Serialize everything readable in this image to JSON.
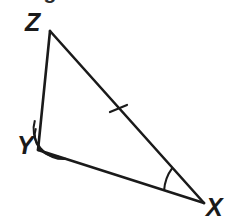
{
  "figure": {
    "name": "triangle-XYZ",
    "background_color": "#ffffff",
    "stroke_color": "#1a1a1a",
    "label_color": "#1a1a1a",
    "width": 230,
    "height": 224
  },
  "cropped_header": {
    "text": "n figure XYZ below"
  },
  "vertices": {
    "Z": {
      "label": "Z",
      "x": 50,
      "y": 31
    },
    "Y": {
      "label": "Y",
      "x": 38,
      "y": 150
    },
    "X": {
      "label": "X",
      "x": 204,
      "y": 203
    }
  },
  "sides": [
    {
      "name": "side-ZY",
      "from": "Z",
      "to": "Y",
      "ticks": 0
    },
    {
      "name": "side-YX",
      "from": "Y",
      "to": "X",
      "ticks": 0
    },
    {
      "name": "side-ZX",
      "from": "Z",
      "to": "X",
      "ticks": 1
    }
  ],
  "angle_marks": [
    {
      "name": "angle-mark-Y",
      "vertex": "Y",
      "arcs": 2
    },
    {
      "name": "angle-mark-X",
      "vertex": "X",
      "arcs": 1
    }
  ],
  "tick_marks": [
    {
      "name": "tick-mark-side-ZX",
      "on_side": "side-ZX",
      "x": 118,
      "y": 110
    }
  ]
}
